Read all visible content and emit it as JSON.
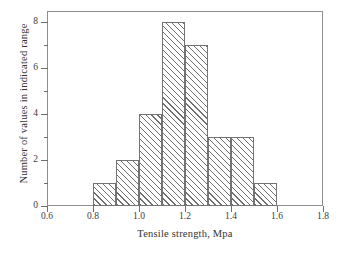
{
  "chart_data": {
    "type": "bar",
    "title": "",
    "subtitle": "",
    "xlabel": "Tensile strength, Mpa",
    "ylabel": "Number of values in indicated range",
    "xlim": [
      0.6,
      1.8
    ],
    "ylim": [
      0,
      8.5
    ],
    "bin_width": 0.1,
    "grid": false,
    "legend": null,
    "x_major_ticks": [
      "0.6",
      "0.8",
      "1.0",
      "1.2",
      "1.4",
      "1.6",
      "1.8"
    ],
    "x_major_tick_values": [
      0.6,
      0.8,
      1.0,
      1.2,
      1.4,
      1.6,
      1.8
    ],
    "y_major_ticks": [
      "0",
      "2",
      "4",
      "6",
      "8"
    ],
    "y_major_tick_values": [
      0,
      2,
      4,
      6,
      8
    ],
    "y_minor_tick_values": [
      1,
      3,
      5,
      7
    ],
    "categories": [
      "0.8-0.9",
      "0.9-1.0",
      "1.0-1.1",
      "1.1-1.2",
      "1.2-1.3",
      "1.3-1.4",
      "1.4-1.5",
      "1.5-1.6"
    ],
    "bin_edges": [
      0.8,
      0.9,
      1.0,
      1.1,
      1.2,
      1.3,
      1.4,
      1.5,
      1.6
    ],
    "values": [
      1,
      2,
      4,
      8,
      7,
      3,
      3,
      1
    ],
    "total_count": 29,
    "bars": [
      {
        "bin_start": 0.8,
        "bin_end": 0.9,
        "value": 1
      },
      {
        "bin_start": 0.9,
        "bin_end": 1.0,
        "value": 2
      },
      {
        "bin_start": 1.0,
        "bin_end": 1.1,
        "value": 4
      },
      {
        "bin_start": 1.1,
        "bin_end": 1.2,
        "value": 8
      },
      {
        "bin_start": 1.2,
        "bin_end": 1.3,
        "value": 7
      },
      {
        "bin_start": 1.3,
        "bin_end": 1.4,
        "value": 3
      },
      {
        "bin_start": 1.4,
        "bin_end": 1.5,
        "value": 3
      },
      {
        "bin_start": 1.5,
        "bin_end": 1.6,
        "value": 1
      }
    ],
    "colors": {
      "bar_fill": "#ffffff",
      "bar_hatch": "#6e6e6e",
      "bar_edge": "#737373",
      "frame": "#8d8d8d",
      "text": "#333333",
      "background": "#ffffff"
    },
    "style": {
      "hatch": "forward-diagonal",
      "bar_edge_width": 1
    }
  }
}
